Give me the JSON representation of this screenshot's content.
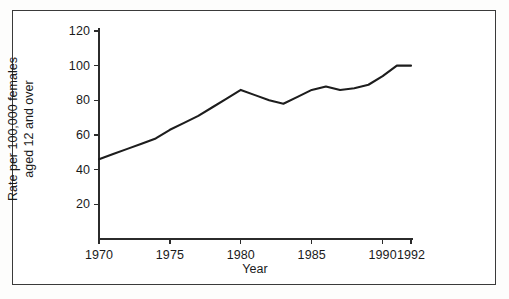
{
  "chart_data": {
    "type": "line",
    "title": "",
    "xlabel": "Year",
    "ylabel": "Rate per 100,000 females aged 12 and over",
    "ylabel_line1": "Rate per 100,000 females",
    "ylabel_line2": "aged 12 and over",
    "xlim": [
      1970,
      1992
    ],
    "ylim": [
      0,
      120
    ],
    "grid": false,
    "legend": false,
    "line_color": "#1d1d1d",
    "x_ticks": [
      1970,
      1975,
      1980,
      1985,
      1990,
      1992
    ],
    "x_tick_labels": [
      "1970",
      "1975",
      "1980",
      "1985",
      "1990",
      "1992"
    ],
    "y_ticks": [
      20,
      40,
      60,
      80,
      100,
      120
    ],
    "y_tick_labels": [
      "20",
      "40",
      "60",
      "80",
      "100",
      "120"
    ],
    "x": [
      1970,
      1971,
      1972,
      1973,
      1974,
      1975,
      1976,
      1977,
      1978,
      1979,
      1980,
      1981,
      1982,
      1983,
      1984,
      1985,
      1986,
      1987,
      1988,
      1989,
      1990,
      1991,
      1992
    ],
    "values": [
      46,
      49,
      52,
      55,
      58,
      63,
      67,
      71,
      76,
      81,
      86,
      83,
      80,
      78,
      82,
      86,
      88,
      86,
      87,
      89,
      94,
      100,
      100
    ],
    "series": [
      {
        "name": "Rate per 100,000 females aged 12 and over",
        "values": [
          46,
          49,
          52,
          55,
          58,
          63,
          67,
          71,
          76,
          81,
          86,
          83,
          80,
          78,
          82,
          86,
          88,
          86,
          87,
          89,
          94,
          100,
          100
        ]
      }
    ]
  },
  "figure": {
    "border_color": "#3a3a3a",
    "background": "#ffffff"
  }
}
